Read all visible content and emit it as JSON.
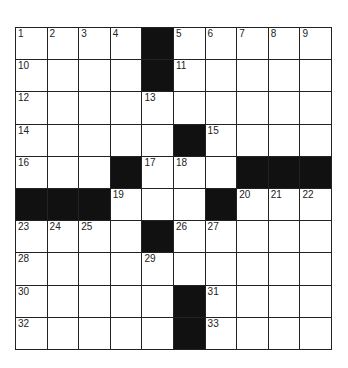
{
  "puzzle": {
    "rows": 10,
    "cols": 10,
    "grid": [
      [
        "1",
        "2",
        "3",
        "4",
        "#",
        "5",
        "6",
        "7",
        "8",
        "9"
      ],
      [
        "10",
        "",
        "",
        "",
        "#",
        "11",
        "",
        "",
        "",
        ""
      ],
      [
        "12",
        "",
        "",
        "",
        "13",
        "",
        "",
        "",
        "",
        ""
      ],
      [
        "14",
        "",
        "",
        "",
        "",
        "#",
        "15",
        "",
        "",
        ""
      ],
      [
        "16",
        "",
        "",
        "#",
        "17",
        "18",
        "",
        "#",
        "#",
        "#"
      ],
      [
        "#",
        "#",
        "#",
        "19",
        "",
        "",
        "#",
        "20",
        "21",
        "22"
      ],
      [
        "23",
        "24",
        "25",
        "",
        "#",
        "26",
        "27",
        "",
        "",
        ""
      ],
      [
        "28",
        "",
        "",
        "",
        "29",
        "",
        "",
        "",
        "",
        ""
      ],
      [
        "30",
        "",
        "",
        "",
        "",
        "#",
        "31",
        "",
        "",
        ""
      ],
      [
        "32",
        "",
        "",
        "",
        "",
        "#",
        "33",
        "",
        "",
        ""
      ]
    ]
  },
  "colors": {
    "block": "#111111",
    "line": "#222222",
    "cell": "#ffffff"
  }
}
